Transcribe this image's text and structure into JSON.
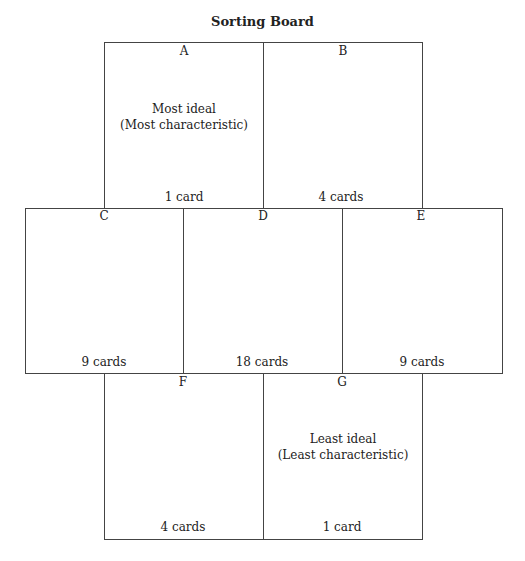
{
  "title": "Sorting Board",
  "boxes": {
    "A": {
      "label": "A",
      "count": "1 card",
      "desc1": "Most ideal",
      "desc2": "(Most characteristic)"
    },
    "B": {
      "label": "B",
      "count": "4 cards"
    },
    "C": {
      "label": "C",
      "count": "9 cards"
    },
    "D": {
      "label": "D",
      "count": "18 cards"
    },
    "E": {
      "label": "E",
      "count": "9 cards"
    },
    "F": {
      "label": "F",
      "count": "4 cards"
    },
    "G": {
      "label": "G",
      "count": "1 card",
      "desc1": "Least ideal",
      "desc2": "(Least characteristic)"
    }
  }
}
